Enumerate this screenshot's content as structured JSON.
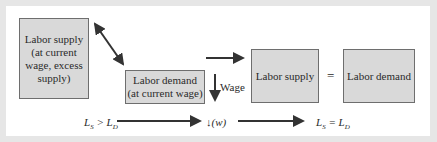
{
  "diagram": {
    "boxes": {
      "supply_excess": "Labor supply (at current wage, excess supply)",
      "demand_current": "Labor demand (at current wage)",
      "supply_eq": "Labor supply",
      "demand_eq": "Labor demand"
    },
    "equals_sign": "=",
    "wage_label": "Wage",
    "bottom_row": {
      "start": "L_S > L_D",
      "middle": "↓(w)",
      "end": "L_S = L_D"
    },
    "colors": {
      "box_fill": "#d9d9d9",
      "box_border": "#6e6e6e",
      "arrow": "#333333",
      "frame": "#e6e6e6"
    }
  }
}
